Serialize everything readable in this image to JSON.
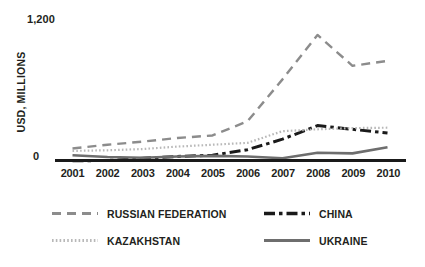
{
  "chart_data": {
    "type": "line",
    "title": "",
    "xlabel": "",
    "ylabel": "USD, MILLIONS",
    "categories": [
      "2001",
      "2002",
      "2003",
      "2004",
      "2005",
      "2006",
      "2007",
      "2008",
      "2009",
      "2010"
    ],
    "ylim": [
      0,
      1200
    ],
    "ytick_labels": [
      "0",
      "1,200"
    ],
    "grid": false,
    "legend_position": "bottom",
    "series": [
      {
        "name": "RUSSIAN FEDERATION",
        "style": "dashed",
        "color": "#8c8c8c",
        "values": [
          110,
          140,
          165,
          195,
          215,
          330,
          670,
          1030,
          780,
          820
        ]
      },
      {
        "name": "CHINA",
        "style": "dash-dot",
        "color": "#1a1a1a",
        "values": [
          10,
          12,
          30,
          45,
          55,
          100,
          185,
          295,
          265,
          235
        ]
      },
      {
        "name": "KAZAKHSTAN",
        "style": "dotted",
        "color": "#b8b8b8",
        "values": [
          90,
          95,
          105,
          125,
          140,
          155,
          250,
          265,
          275,
          278
        ]
      },
      {
        "name": "UKRAINE",
        "style": "solid",
        "color": "#6e6e6e",
        "values": [
          55,
          40,
          35,
          45,
          50,
          45,
          30,
          75,
          70,
          120
        ]
      }
    ]
  },
  "axis": {
    "y_top_label": "1,200",
    "y_zero_label": "0",
    "y_title": "USD, MILLIONS"
  },
  "legend": {
    "items": [
      {
        "label": "RUSSIAN FEDERATION",
        "series_index": 0
      },
      {
        "label": "CHINA",
        "series_index": 1
      },
      {
        "label": "KAZAKHSTAN",
        "series_index": 2
      },
      {
        "label": "UKRAINE",
        "series_index": 3
      }
    ]
  }
}
